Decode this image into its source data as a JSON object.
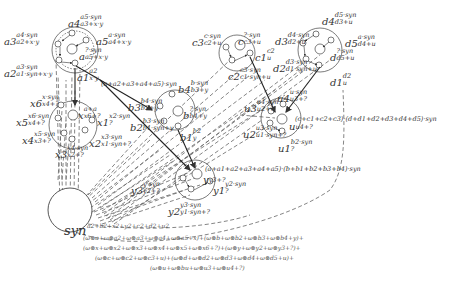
{
  "diagram": {
    "title_symbol": "syn",
    "colors": {
      "stroke": "#444444",
      "dash": "#555555",
      "text": "#333333",
      "formula": "#555555",
      "background": "#ffffff"
    },
    "groups": {
      "a": [
        {
          "id": "a4",
          "main": "a4",
          "sup": "a5·syn",
          "sub": "a3+x·y"
        },
        {
          "id": "a3",
          "main": "a3",
          "sup": "a4·syn",
          "sub": "a2+x·y"
        },
        {
          "id": "a5",
          "main": "a5",
          "sup": "a·syn",
          "sub": "a4+x·y"
        },
        {
          "id": "a",
          "main": "a",
          "sup": "?·syn",
          "sub": "a5+x·y"
        },
        {
          "id": "a2",
          "main": "a2",
          "sup": "a3·syn",
          "sub": "a1·syn+x·y"
        },
        {
          "id": "a1",
          "main": "a1",
          "sup": "a2",
          "sub": "x·y"
        }
      ],
      "x": [
        {
          "id": "x6",
          "main": "x6",
          "sup": "x·syn",
          "sub": "x4+?"
        },
        {
          "id": "x",
          "main": "x",
          "sup": "a+a",
          "sub": "x6+?"
        },
        {
          "id": "x5",
          "main": "x5",
          "sup": "x6·syn",
          "sub": "x4+?"
        },
        {
          "id": "x1",
          "main": "x1",
          "sup": "x2·syn",
          "sub": "?"
        },
        {
          "id": "x4",
          "main": "x4",
          "sup": "x5·syn",
          "sub": "x3+?"
        },
        {
          "id": "x2",
          "main": "x2",
          "sup": "x3·syn",
          "sub": "x1·syn+?"
        },
        {
          "id": "x3",
          "main": "x3",
          "sup": "x4·syn",
          "sub": "x2+?"
        }
      ],
      "b": [
        {
          "id": "b4",
          "main": "b4",
          "sup": "b·syn",
          "sub": "b3+y"
        },
        {
          "id": "b3",
          "main": "b3",
          "sup": "b4·syn",
          "sub": "b2+y"
        },
        {
          "id": "b",
          "main": "b",
          "sup": "?·syn",
          "sub": "b4+y"
        },
        {
          "id": "b2",
          "main": "b2",
          "sup": "b3·syn",
          "sub": "b1·syn+y"
        },
        {
          "id": "b1",
          "main": "b1",
          "sup": "b2",
          "sub": "y"
        }
      ],
      "c": [
        {
          "id": "c3",
          "main": "c3",
          "sup": "c·syn",
          "sub": "c2+u"
        },
        {
          "id": "c",
          "main": "c",
          "sup": "?·syn",
          "sub": "c3+u"
        },
        {
          "id": "c1",
          "main": "c1",
          "sup": "c2",
          "sub": "u"
        },
        {
          "id": "c2",
          "main": "c2",
          "sup": "c3·syn",
          "sub": "c1·syn+u"
        }
      ],
      "d": [
        {
          "id": "d4",
          "main": "d4",
          "sup": "d5·syn",
          "sub": "d3+u"
        },
        {
          "id": "d3",
          "main": "d3",
          "sup": "d4·syn",
          "sub": "d2+u"
        },
        {
          "id": "d5",
          "main": "d5",
          "sup": "a·syn",
          "sub": "d4+u"
        },
        {
          "id": "d",
          "main": "d",
          "sup": "?·syn",
          "sub": "d5+u"
        },
        {
          "id": "d2",
          "main": "d2",
          "sup": "d3·syn",
          "sub": "d1·syn+u"
        },
        {
          "id": "d1",
          "main": "d1",
          "sup": "d2",
          "sub": "u"
        }
      ],
      "u": [
        {
          "id": "u4",
          "main": "u4",
          "sup": "u·syn",
          "sub": "u3+?"
        },
        {
          "id": "u3",
          "main": "u3",
          "sup": "u4·syn",
          "sub": "u2+?"
        },
        {
          "id": "u",
          "main": "u",
          "sup": "",
          "sub": "u4+?"
        },
        {
          "id": "u2",
          "main": "u2",
          "sup": "u3·syn",
          "sub": "u1·syn+?"
        },
        {
          "id": "u1",
          "main": "u1",
          "sup": "b2·syn",
          "sub": "?"
        }
      ],
      "y": [
        {
          "id": "y",
          "main": "y",
          "sup": "",
          "sub": "y3+?"
        },
        {
          "id": "y3",
          "main": "y3",
          "sup": "y·syn",
          "sub": "y2+?"
        },
        {
          "id": "y1",
          "main": "y1",
          "sup": "y2·syn",
          "sub": "?"
        },
        {
          "id": "y2",
          "main": "y2",
          "sup": "y3·syn",
          "sub": "y1·syn+?"
        }
      ]
    },
    "edge_labels": {
      "a_to_b": "(a+a2+a3+a4+a5)·syn",
      "ab_to_y": "(a+a1+a2+a3+a4+a5)·(b+b1+b2+b3+b4)·syn",
      "cd_to_u": "(c+c1+c2+c3)·(d+d1+d2+d3+d4+d5)·syn"
    },
    "formula": {
      "exponent": "a2+b2+x2+y2+c2+d2+u2",
      "lines": [
        "(ω⊗a+ω⊗a2+ω⊗a3+ω⊗a4+ω⊗a5+x)+(ω⊗b+ω⊗b2+ω⊗b3+ω⊗b4+y)+",
        "(ω⊗x+ω⊗x2+ω⊗x3+ω⊗x4+ω⊗x5+ω⊗x6+?)+(ω⊗y+ω⊗y2+ω⊗y3+?)+",
        "(ω⊗c+ω⊗c2+ω⊗c3+u)+(ω⊗d+ω⊗d2+ω⊗d3+ω⊗d4+ω⊗d5+u)+",
        "(ω⊗u+ω⊗bu+ω⊗u3+ω⊗u4+?)"
      ]
    }
  }
}
